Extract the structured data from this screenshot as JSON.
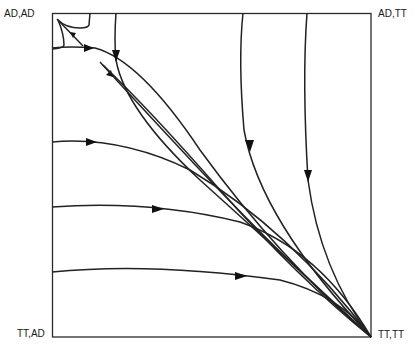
{
  "diagram": {
    "type": "phase-portrait",
    "corners": {
      "top_left": "AD,AD",
      "top_right": "AD,TT",
      "bottom_left": "TT,AD",
      "bottom_right": "TT,TT"
    },
    "stroke_color": "#222222",
    "background_color": "#ffffff",
    "trajectories": [
      {
        "id": "left-1",
        "start": "left edge, upper",
        "end": "TT,TT",
        "arrow": "rightward"
      },
      {
        "id": "left-2",
        "start": "left edge, middle-upper",
        "end": "TT,TT",
        "arrow": "rightward"
      },
      {
        "id": "left-3",
        "start": "left edge, middle-lower",
        "end": "TT,TT",
        "arrow": "rightward"
      },
      {
        "id": "left-4",
        "start": "left edge, lower",
        "end": "TT,TT",
        "arrow": "rightward"
      },
      {
        "id": "top-1",
        "start": "top edge, left",
        "end": "TT,TT",
        "arrow": "downward"
      },
      {
        "id": "top-2",
        "start": "top edge, middle",
        "end": "TT,TT",
        "arrow": "downward"
      },
      {
        "id": "top-3",
        "start": "top edge, right",
        "end": "TT,TT",
        "arrow": "downward"
      },
      {
        "id": "interior-1",
        "start": "interior near AD,AD",
        "end": "TT,TT",
        "arrow": "down-right"
      },
      {
        "id": "to-corner",
        "start": "interior",
        "end": "AD,AD",
        "arrow": "up-left"
      },
      {
        "id": "separatrix",
        "start": "top edge",
        "end": "left edge",
        "arrow": "none"
      }
    ]
  }
}
